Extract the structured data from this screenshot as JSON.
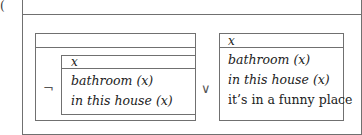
{
  "label": "(",
  "outer_box": {
    "referents": ""
  },
  "negated_box": {
    "operator": "¬",
    "referents": "",
    "inner_box": {
      "referents": "x",
      "conditions": [
        "bathroom (x)",
        "in this house (x)"
      ]
    }
  },
  "disjunction_operator": "∨",
  "right_box": {
    "referents": "x",
    "conditions": [
      "bathroom (x)",
      "in this house (x)",
      "it’s in a funny place"
    ]
  }
}
